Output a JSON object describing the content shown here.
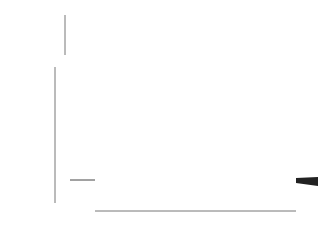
{
  "chart_data": [
    {
      "type": "line",
      "title": "",
      "xlabel": "",
      "ylabel": "V_C (mV)",
      "ylim": [
        -60,
        60
      ],
      "yticks": [
        "60",
        "20",
        "−20",
        "−60"
      ],
      "description": "Voltage-clamp command steps from holding −60 mV to −40…60 mV in 10 mV increments, from t=0 to t=8 ms",
      "holding_mV": -60,
      "steps_mV": [
        -40,
        -30,
        -20,
        -10,
        0,
        10,
        20,
        30,
        40,
        50,
        60
      ],
      "step_start_ms": 0,
      "step_end_ms": 8
    },
    {
      "type": "line",
      "title": "",
      "xlabel": "time (msec)",
      "ylabel": "I (mA/cm²)",
      "xlim": [
        0,
        8
      ],
      "ylim": [
        -1,
        5
      ],
      "xticks": [
        "0",
        "1",
        "2",
        "3",
        "4",
        "5",
        "6",
        "7",
        "8"
      ],
      "yticks": [
        "5",
        "4",
        "3",
        "2",
        "1",
        "0",
        "−1"
      ],
      "grid": false,
      "legend": "inline labels at right end of each curve (mV)",
      "x": [
        0,
        0.5,
        1,
        1.5,
        2,
        3,
        4,
        5,
        6,
        7,
        8
      ],
      "series": [
        {
          "name": "60",
          "values": [
            0.05,
            0.6,
            1.5,
            2.4,
            3.1,
            3.9,
            4.2,
            4.4,
            4.5,
            4.55,
            4.6
          ]
        },
        {
          "name": "50",
          "values": [
            0.05,
            0.45,
            1.25,
            2.1,
            2.75,
            3.55,
            3.9,
            4.05,
            4.15,
            4.2,
            4.25
          ]
        },
        {
          "name": "40",
          "values": [
            0.05,
            0.3,
            1.0,
            1.75,
            2.4,
            3.15,
            3.5,
            3.7,
            3.8,
            3.85,
            3.9
          ]
        },
        {
          "name": "30",
          "values": [
            0.05,
            0.15,
            0.75,
            1.45,
            2.0,
            2.75,
            3.1,
            3.3,
            3.4,
            3.45,
            3.5
          ]
        },
        {
          "name": "20",
          "values": [
            0.05,
            0.0,
            0.45,
            1.1,
            1.6,
            2.35,
            2.7,
            2.9,
            3.0,
            3.05,
            3.1
          ]
        },
        {
          "name": "10",
          "values": [
            0.05,
            -0.15,
            0.15,
            0.75,
            1.25,
            1.95,
            2.3,
            2.5,
            2.6,
            2.65,
            2.7
          ]
        },
        {
          "name": "0",
          "values": [
            0.05,
            -0.3,
            -0.1,
            0.4,
            0.85,
            1.5,
            1.85,
            2.05,
            2.15,
            2.2,
            2.25
          ]
        },
        {
          "name": "-10",
          "values": [
            0.05,
            -0.45,
            -0.35,
            0.05,
            0.45,
            1.05,
            1.4,
            1.6,
            1.7,
            1.75,
            1.8
          ]
        },
        {
          "name": "-20",
          "values": [
            0.05,
            -0.55,
            -0.55,
            -0.25,
            0.1,
            0.65,
            0.95,
            1.15,
            1.25,
            1.3,
            1.35
          ]
        },
        {
          "name": "-30",
          "values": [
            0.05,
            -0.6,
            -0.7,
            -0.5,
            -0.2,
            0.25,
            0.5,
            0.7,
            0.8,
            0.85,
            0.9
          ]
        },
        {
          "name": "-40",
          "values": [
            0.05,
            -0.6,
            -0.75,
            -0.65,
            -0.45,
            -0.1,
            0.15,
            0.3,
            0.4,
            0.45,
            0.5
          ]
        }
      ],
      "curve_labels": [
        "60",
        "50",
        "40",
        "30",
        "20",
        "10",
        "0",
        "−10",
        "−20",
        "−30",
        "−40"
      ]
    }
  ],
  "labels": {
    "top_ylabel_main": "V",
    "top_ylabel_sub": "C",
    "top_ylabel_unit": " (mV)",
    "bottom_ylabel_main": "I",
    "bottom_ylabel_unit": " (mA/cm",
    "bottom_ylabel_sup": "2",
    "bottom_ylabel_close": ")",
    "xlabel": "time (msec)"
  }
}
